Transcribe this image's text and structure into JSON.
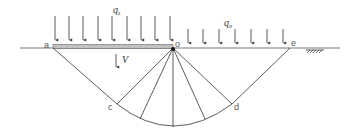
{
  "diagram": {
    "type": "bearing-capacity failure mechanism (Prandtl)",
    "labels": {
      "a": "a",
      "o": "o",
      "e": "e",
      "c": "c",
      "d": "d",
      "q_footing": "q",
      "q_footing_sub": "s",
      "q_surcharge": "q",
      "q_surcharge_sub": "o",
      "velocity": "V"
    },
    "colors": {
      "line": "#333333",
      "footing_fill": "#bfbfbf",
      "label": "#555555"
    },
    "points": {
      "a": [
        53,
        47
      ],
      "o": [
        173,
        48
      ],
      "e": [
        290,
        48
      ],
      "c": [
        117,
        104
      ],
      "d": [
        232,
        104
      ],
      "bottom": [
        173,
        128
      ]
    },
    "loads": {
      "footing_arrow_x": [
        55,
        69,
        83,
        98,
        112,
        127,
        141,
        155,
        170
      ],
      "surcharge_arrow_x": [
        188,
        203,
        219,
        235,
        251,
        267,
        283
      ]
    }
  }
}
